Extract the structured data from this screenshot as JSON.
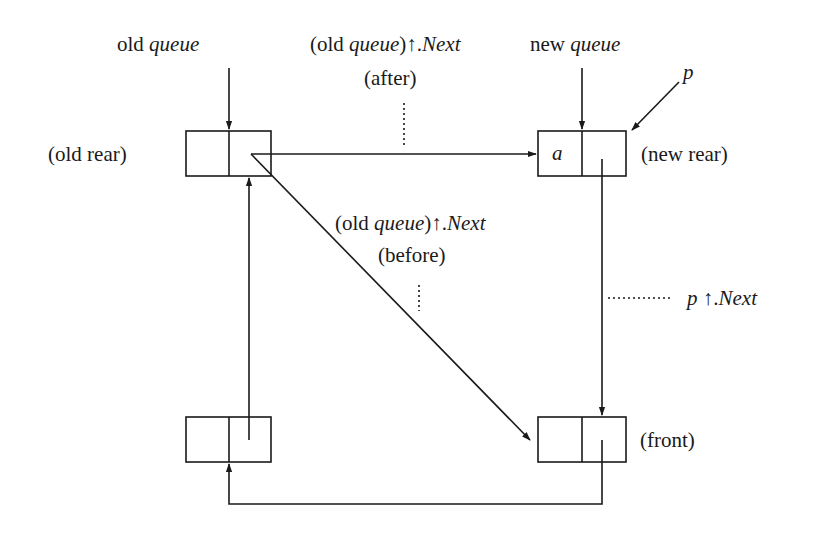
{
  "diagram": {
    "type": "linked-queue-insertion",
    "colors": {
      "ink": "#1a1a1a",
      "background": "#ffffff"
    },
    "nodes": [
      {
        "id": "old-rear",
        "label": "(old rear)",
        "value": ""
      },
      {
        "id": "new-rear",
        "label": "(new rear)",
        "value": "a"
      },
      {
        "id": "bottom-left",
        "label": "",
        "value": ""
      },
      {
        "id": "front",
        "label": "(front)",
        "value": ""
      }
    ],
    "pointer_labels": {
      "old_queue": {
        "prefix": "old",
        "var": "queue"
      },
      "new_queue": {
        "prefix": "new",
        "var": "queue"
      },
      "p": "p"
    },
    "annotations": {
      "after": {
        "open": "(old ",
        "var": "queue",
        "close": ")",
        "arrow": "↑.",
        "field": "Next",
        "note": "(after)"
      },
      "before": {
        "open": "(old ",
        "var": "queue",
        "close": ")",
        "arrow": "↑.",
        "field": "Next",
        "note": "(before)"
      },
      "p_next": {
        "var": "p",
        "arrow": " ↑.",
        "field": "Next"
      }
    },
    "edges": [
      {
        "from": "old-rear",
        "to": "new-rear",
        "style": "solid",
        "meaning": "(old queue)↑.Next (after)"
      },
      {
        "from": "old-rear",
        "to": "front",
        "style": "solid",
        "meaning": "(old queue)↑.Next (before)"
      },
      {
        "from": "new-rear",
        "to": "front",
        "style": "solid",
        "meaning": "p↑.Next"
      },
      {
        "from": "front",
        "to": "bottom-left",
        "style": "solid"
      },
      {
        "from": "bottom-left",
        "to": "old-rear",
        "style": "solid"
      }
    ]
  }
}
